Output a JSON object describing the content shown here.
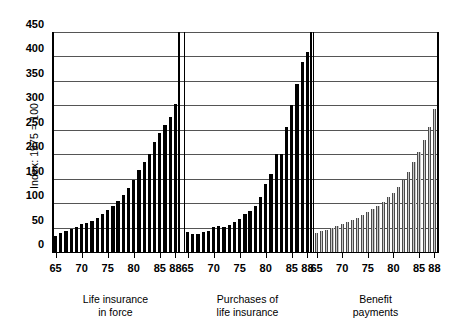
{
  "chart_data": {
    "type": "bar",
    "title": "",
    "subtitle": "",
    "ylabel": "Index: 1975 = 100",
    "xlabel": "",
    "ylim": [
      0,
      450
    ],
    "yticks": [
      0,
      50,
      100,
      150,
      200,
      250,
      300,
      350,
      400,
      450
    ],
    "ytick_labels": [
      "0",
      "50",
      "100",
      "150",
      "200",
      "250",
      "300",
      "350",
      "400",
      "450"
    ],
    "grid": true,
    "grid_axis": "y",
    "legend": "none",
    "panels": [
      {
        "name": "life-insurance-in-force",
        "caption_line1": "Life insurance",
        "caption_line2": "in force",
        "bar_style": "solid-black",
        "bar_color": "#000000",
        "xtick_labels": [
          "65",
          "70",
          "75",
          "80",
          "85",
          "88"
        ],
        "xtick_years": [
          65,
          70,
          75,
          80,
          85,
          88
        ],
        "x": [
          65,
          66,
          67,
          68,
          69,
          70,
          71,
          72,
          73,
          74,
          75,
          76,
          77,
          78,
          79,
          80,
          81,
          82,
          83,
          84,
          85,
          86,
          87,
          88
        ],
        "values": [
          33,
          38,
          43,
          48,
          52,
          57,
          60,
          64,
          70,
          77,
          86,
          95,
          105,
          117,
          130,
          147,
          168,
          185,
          200,
          225,
          244,
          260,
          277,
          303
        ]
      },
      {
        "name": "purchases-of-life-insurance",
        "caption_line1": "Purchases of",
        "caption_line2": "life insurance",
        "bar_style": "solid-black",
        "bar_color": "#000000",
        "xtick_labels": [
          "65",
          "70",
          "75",
          "80",
          "85",
          "88"
        ],
        "xtick_years": [
          65,
          70,
          75,
          80,
          85,
          88
        ],
        "x": [
          65,
          66,
          67,
          68,
          69,
          70,
          71,
          72,
          73,
          74,
          75,
          76,
          77,
          78,
          79,
          80,
          81,
          82,
          83,
          84,
          85,
          86,
          87,
          88
        ],
        "values": [
          41,
          36,
          36,
          40,
          43,
          52,
          54,
          51,
          56,
          62,
          68,
          77,
          83,
          95,
          112,
          140,
          160,
          200,
          200,
          255,
          300,
          343,
          388,
          410
        ]
      },
      {
        "name": "benefit-payments",
        "caption_line1": "Benefit",
        "caption_line2": "payments",
        "bar_style": "gray-striped",
        "bar_color": "#8d8d8d",
        "xtick_labels": [
          "65",
          "70",
          "75",
          "80",
          "85",
          "88"
        ],
        "xtick_years": [
          65,
          70,
          75,
          80,
          85,
          88
        ],
        "x": [
          65,
          66,
          67,
          68,
          69,
          70,
          71,
          72,
          73,
          74,
          75,
          76,
          77,
          78,
          79,
          80,
          81,
          82,
          83,
          84,
          85,
          86,
          87,
          88
        ],
        "values": [
          39,
          42,
          46,
          50,
          54,
          58,
          62,
          66,
          70,
          75,
          81,
          88,
          95,
          103,
          112,
          121,
          133,
          148,
          163,
          185,
          205,
          230,
          255,
          292
        ]
      }
    ]
  }
}
